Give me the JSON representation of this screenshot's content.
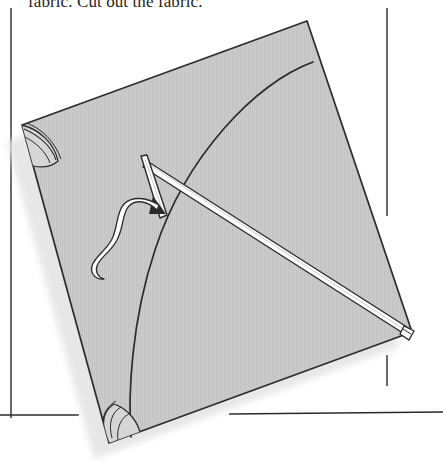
{
  "page": {
    "width": 443,
    "height": 469,
    "background": "#ffffff",
    "type": "scanned-book-illustration"
  },
  "caption": {
    "text": "fabric. Cut out the fabric.",
    "note": "clipped by top edge of the page crop"
  },
  "rules": {
    "left_column_rule": {
      "x": 11,
      "y1": 8,
      "y2": 418,
      "color": "#2a2a2a"
    },
    "right_column_rule_upper": {
      "x": 387,
      "y1": 8,
      "y2": 216,
      "color": "#2a2a2a"
    },
    "right_column_rule_lower": {
      "x": 387,
      "y1": 355,
      "y2": 386,
      "color": "#2a2a2a"
    },
    "bottom_rule_left": {
      "y": 415,
      "x1": 0,
      "x2": 79,
      "color": "#2a2a2a"
    },
    "bottom_rule_right": {
      "y": 413,
      "x1": 229,
      "x2": 443,
      "color": "#2a2a2a"
    }
  },
  "illustration": {
    "name": "diamond-kite-sail-assembly",
    "description": "A tilted square kite sail with a curved hem line, crossed white spars, a corner ribbon loop, and reinforced corner pockets.",
    "sail": {
      "corners": {
        "top": [
          307,
          21
        ],
        "right": [
          412,
          332
        ],
        "bottom": [
          109,
          443
        ],
        "left": [
          22,
          125
        ]
      },
      "fill_color": "#c9c9c9",
      "texture": "fine vertical halftone lines",
      "outline_color": "#2b2b2b"
    },
    "hem_arc": {
      "from": [
        313,
        62
      ],
      "to": [
        131,
        437
      ],
      "description": "curved stitch line sweeping from upper right edge to lower bottom edge"
    },
    "shadow": {
      "color": "#e9e9e9",
      "side": "lower-left"
    },
    "spars": [
      {
        "name": "long-spar",
        "from": [
          148,
          162
        ],
        "to": [
          409,
          330
        ],
        "fill": "#ffffff",
        "edge": "#2b2b2b"
      },
      {
        "name": "short-spar",
        "from": [
          143,
          158
        ],
        "to": [
          163,
          218
        ],
        "fill": "#ffffff",
        "edge": "#2b2b2b"
      }
    ],
    "ribbon": {
      "name": "tie-string-loop",
      "fill": "#ffffff",
      "edge": "#2b2b2b",
      "description": "wavy looped string hanging from the spar crossing point"
    },
    "corner_pockets": [
      {
        "name": "left-corner-pocket",
        "at": [
          22,
          125
        ]
      },
      {
        "name": "bottom-corner-pocket",
        "at": [
          109,
          443
        ]
      },
      {
        "name": "right-corner-tip",
        "at": [
          412,
          332
        ]
      }
    ]
  },
  "colors": {
    "ink": "#2b2b2b",
    "fabric": "#c9c9c9",
    "shadow": "#e9e9e9",
    "paper": "#ffffff"
  }
}
